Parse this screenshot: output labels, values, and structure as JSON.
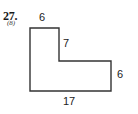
{
  "problem": {
    "number": "27.",
    "subnumber": "(8)"
  },
  "figure": {
    "name": "l-shaped-polygon",
    "stroke_color": "#333333",
    "fill_color": "#ffffff",
    "vertices": [
      [
        30,
        28
      ],
      [
        59,
        28
      ],
      [
        59,
        61
      ],
      [
        111,
        61
      ],
      [
        111,
        91
      ],
      [
        30,
        91
      ]
    ],
    "labels": {
      "top": "6",
      "inner_vertical": "7",
      "right_vertical": "6",
      "bottom": "17"
    }
  },
  "chart_data": {
    "type": "diagram",
    "title": "",
    "shape": "L-shaped polygon",
    "dimensions": [
      {
        "edge": "top",
        "value": 6
      },
      {
        "edge": "inner-vertical",
        "value": 7
      },
      {
        "edge": "right-vertical",
        "value": 6
      },
      {
        "edge": "bottom",
        "value": 17
      }
    ]
  }
}
